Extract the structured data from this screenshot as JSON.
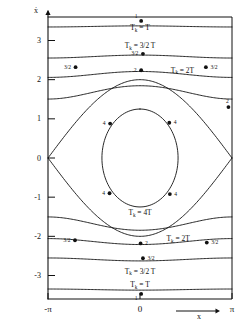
{
  "figure": {
    "name": "phase-space-portrait",
    "axes": {
      "y_axis_label": "ẋ",
      "x_axis_label": "x",
      "x_ticks": [
        {
          "value": -3.14159,
          "label": "-π"
        },
        {
          "value": 0,
          "label": "0"
        },
        {
          "value": 3.14159,
          "label": "π"
        }
      ],
      "y_ticks": [
        {
          "value": 3,
          "label": "3"
        },
        {
          "value": 2,
          "label": "2"
        },
        {
          "value": 1,
          "label": "1"
        },
        {
          "value": 0,
          "label": "0"
        },
        {
          "value": -1,
          "label": "-1"
        },
        {
          "value": -2,
          "label": "-2"
        },
        {
          "value": -3,
          "label": "-3"
        }
      ],
      "xlim": [
        -3.14159,
        3.14159
      ],
      "ylim": [
        -3.6,
        3.6
      ],
      "grid": false
    },
    "curve_labels": [
      {
        "id": "lbl-top-T",
        "text": "Tₖ = T",
        "x": 0.0,
        "y": 3.27
      },
      {
        "id": "lbl-top-3half",
        "text": "Tₖ = 3/2 T",
        "x": 0.0,
        "y": 2.8
      },
      {
        "id": "lbl-right-2T",
        "text": "Tₖ = 2T",
        "x": 1.45,
        "y": 2.18
      },
      {
        "id": "lbl-center-4T",
        "text": "Tₖ = 4T",
        "x": 0.0,
        "y": -1.45
      },
      {
        "id": "lbl-low-2T",
        "text": "Tₖ = 2T",
        "x": 1.3,
        "y": -2.12
      },
      {
        "id": "lbl-low-3half",
        "text": "Tₖ = 3/2 T",
        "x": 0.0,
        "y": -2.95
      },
      {
        "id": "lbl-bottom-T",
        "text": "Tₖ = T",
        "x": 0.0,
        "y": -3.3
      }
    ],
    "data_points": [
      {
        "label": "1",
        "x": 0.04,
        "y": 3.5,
        "label_pos": "above-left"
      },
      {
        "label": "3/2",
        "x": 0.1,
        "y": 2.66,
        "label_pos": "left"
      },
      {
        "label": "3/2",
        "x": -2.2,
        "y": 2.32,
        "label_pos": "left"
      },
      {
        "label": "3/2",
        "x": 2.25,
        "y": 2.32,
        "label_pos": "right"
      },
      {
        "label": "2",
        "x": 0.04,
        "y": 2.24,
        "label_pos": "left"
      },
      {
        "label": "2",
        "x": 3.02,
        "y": 1.3,
        "label_pos": "above"
      },
      {
        "label": "4",
        "x": -1.02,
        "y": 0.88,
        "label_pos": "left"
      },
      {
        "label": "4",
        "x": 1.0,
        "y": 0.9,
        "label_pos": "right"
      },
      {
        "label": "4",
        "x": -1.04,
        "y": -0.9,
        "label_pos": "left"
      },
      {
        "label": "4",
        "x": 1.02,
        "y": -0.92,
        "label_pos": "right"
      },
      {
        "label": "3/2",
        "x": -2.22,
        "y": -2.1,
        "label_pos": "left"
      },
      {
        "label": "2",
        "x": 0.02,
        "y": -2.18,
        "label_pos": "right"
      },
      {
        "label": "3/2",
        "x": 2.28,
        "y": -2.16,
        "label_pos": "right"
      },
      {
        "label": "3/2",
        "x": 0.1,
        "y": -2.56,
        "label_pos": "right"
      },
      {
        "label": "1",
        "x": 0.04,
        "y": -3.47,
        "label_pos": "below-left"
      }
    ],
    "colors": {
      "ink": "#111111",
      "background": "#ffffff"
    }
  },
  "chart_data": {
    "type": "line",
    "title": "",
    "xlabel": "x",
    "ylabel": "ẋ",
    "xlim": [
      -3.14159,
      3.14159
    ],
    "ylim": [
      -3.6,
      3.6
    ],
    "grid": false,
    "legend": "none",
    "series": [
      {
        "name": "rotation-top-1",
        "energy_label": "Tₖ = T",
        "type": "rotation",
        "y_center": 3.35,
        "amplitude": 0.18
      },
      {
        "name": "rotation-top-2",
        "energy_label": "Tₖ = 3/2 T",
        "type": "rotation",
        "y_center": 2.57,
        "amplitude": 0.3
      },
      {
        "name": "rotation-top-3",
        "energy_label": "Tₖ = 2T",
        "type": "rotation",
        "y_center": 2.1,
        "amplitude": 0.42
      },
      {
        "name": "rotation-top-4",
        "energy_label": "",
        "type": "rotation",
        "y_center": 1.62,
        "amplitude": 0.6
      },
      {
        "name": "separatrix",
        "energy_label": "",
        "type": "separatrix",
        "y_max": 2.0,
        "y_min": -2.0
      },
      {
        "name": "libration-inner",
        "energy_label": "Tₖ = 4T",
        "type": "libration",
        "x_amp": 1.3,
        "y_amp": 1.25
      },
      {
        "name": "rotation-bot-4",
        "energy_label": "",
        "type": "rotation",
        "y_center": -1.62,
        "amplitude": 0.6
      },
      {
        "name": "rotation-bot-3",
        "energy_label": "Tₖ = 2T",
        "type": "rotation",
        "y_center": -2.1,
        "amplitude": 0.42
      },
      {
        "name": "rotation-bot-2",
        "energy_label": "Tₖ = 3/2 T",
        "type": "rotation",
        "y_center": -2.57,
        "amplitude": 0.3
      },
      {
        "name": "rotation-bot-1",
        "energy_label": "Tₖ = T",
        "type": "rotation",
        "y_center": -3.35,
        "amplitude": 0.18
      }
    ],
    "annotated_points": [
      {
        "label": "1",
        "x": 0.04,
        "y": 3.5
      },
      {
        "label": "3/2",
        "x": 0.1,
        "y": 2.66
      },
      {
        "label": "3/2",
        "x": -2.2,
        "y": 2.32
      },
      {
        "label": "3/2",
        "x": 2.25,
        "y": 2.32
      },
      {
        "label": "2",
        "x": 0.04,
        "y": 2.24
      },
      {
        "label": "2",
        "x": 3.02,
        "y": 1.3
      },
      {
        "label": "4",
        "x": -1.02,
        "y": 0.88
      },
      {
        "label": "4",
        "x": 1.0,
        "y": 0.9
      },
      {
        "label": "4",
        "x": -1.04,
        "y": -0.9
      },
      {
        "label": "4",
        "x": 1.02,
        "y": -0.92
      },
      {
        "label": "3/2",
        "x": -2.22,
        "y": -2.1
      },
      {
        "label": "2",
        "x": 0.02,
        "y": -2.18
      },
      {
        "label": "3/2",
        "x": 2.28,
        "y": -2.16
      },
      {
        "label": "3/2",
        "x": 0.1,
        "y": -2.56
      },
      {
        "label": "1",
        "x": 0.04,
        "y": -3.47
      }
    ]
  }
}
